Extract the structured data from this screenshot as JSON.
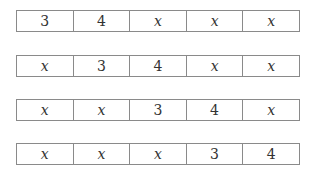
{
  "rows": [
    {
      "cells": [
        "3",
        "4",
        "x",
        "x",
        "x"
      ]
    },
    {
      "cells": [
        "x",
        "3",
        "4",
        "x",
        "x"
      ]
    },
    {
      "cells": [
        "x",
        "x",
        "3",
        "4",
        "x"
      ]
    },
    {
      "cells": [
        "x",
        "x",
        "x",
        "3",
        "4"
      ]
    }
  ]
}
